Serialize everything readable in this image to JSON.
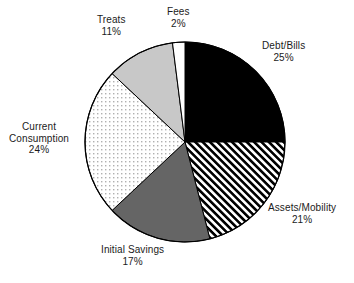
{
  "chart_data": {
    "type": "pie",
    "title": "",
    "subtitle": "",
    "xlabel": "",
    "ylabel": "",
    "legend_position": "none",
    "grid": false,
    "labels_position": "outside",
    "start_angle_deg": 0,
    "direction": "clockwise",
    "units": "percent",
    "categories": [
      "Debt/Bills",
      "Assets/Mobility",
      "Initial Savings",
      "Current Consumption",
      "Treats",
      "Fees"
    ],
    "values": [
      25,
      21,
      17,
      24,
      11,
      2
    ],
    "slices": [
      {
        "name": "Debt/Bills",
        "label_line1": "Debt/Bills",
        "label_line2": "25%",
        "value": 25,
        "value_text": "25%",
        "fill_style": "solid",
        "color": "#000000",
        "stroke": "#000000"
      },
      {
        "name": "Assets/Mobility",
        "label_line1": "Assets/Mobility",
        "label_line2": "21%",
        "value": 21,
        "value_text": "21%",
        "fill_style": "diagonal-stripes",
        "color": "#000000",
        "stroke": "#000000"
      },
      {
        "name": "Initial Savings",
        "label_line1": "Initial Savings",
        "label_line2": "17%",
        "value": 17,
        "value_text": "17%",
        "fill_style": "solid",
        "color": "#656565",
        "stroke": "#000000"
      },
      {
        "name": "Current Consumption",
        "label_line1": "Current",
        "label_line2": "Consumption",
        "label_line3": "24%",
        "value": 24,
        "value_text": "24%",
        "fill_style": "dotted",
        "color": "#c9c9c9",
        "stroke": "#000000"
      },
      {
        "name": "Treats",
        "label_line1": "Treats",
        "label_line2": "11%",
        "value": 11,
        "value_text": "11%",
        "fill_style": "solid",
        "color": "#c8c8c8",
        "stroke": "#000000"
      },
      {
        "name": "Fees",
        "label_line1": "Fees",
        "label_line2": "2%",
        "value": 2,
        "value_text": "2%",
        "fill_style": "solid",
        "color": "#ffffff",
        "stroke": "#000000"
      }
    ],
    "background_color": "#ffffff",
    "text_color": "#1b1b1b"
  }
}
